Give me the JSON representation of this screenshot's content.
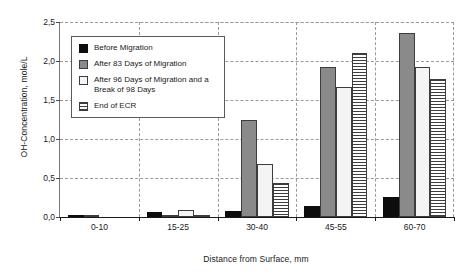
{
  "chart_data": {
    "type": "bar",
    "title": "",
    "xlabel": "Distance from Surface, mm",
    "ylabel": "OH-Concentration, mole/L",
    "categories": [
      "0-10",
      "15-25",
      "30-40",
      "45-55",
      "60-70"
    ],
    "ylim": [
      0,
      2.5
    ],
    "ytick_labels": [
      "0,0",
      "0,5",
      "1,0",
      "1,5",
      "2,0",
      "2,5"
    ],
    "ytick_values": [
      0,
      0.5,
      1.0,
      1.5,
      2.0,
      2.5
    ],
    "grid": true,
    "legend_position": "upper-left-inside",
    "decimal_separator": ",",
    "series": [
      {
        "name": "Before Migration",
        "color": "#0d0d0d",
        "fill": "solid-black",
        "values": [
          0.02,
          0.07,
          0.08,
          0.14,
          0.26
        ]
      },
      {
        "name": "After 83 Days of Migration",
        "color": "#8a8a8a",
        "fill": "solid-gray",
        "values": [
          0.01,
          0.02,
          1.24,
          1.92,
          2.36
        ]
      },
      {
        "name": "After 96 Days of Migration and a Break of 98 Days",
        "color": "#f4f4f4",
        "fill": "solid-white",
        "values": [
          0.0,
          0.09,
          0.68,
          1.67,
          1.92
        ]
      },
      {
        "name": "End of ECR",
        "color": "#3d3d3d",
        "fill": "horizontal-stripes",
        "values": [
          0.0,
          0.02,
          0.44,
          2.1,
          1.77
        ]
      }
    ]
  },
  "legend": {
    "items": [
      {
        "label": "Before Migration",
        "swatch": "swatch-black"
      },
      {
        "label": "After 83 Days of Migration",
        "swatch": "swatch-gray"
      },
      {
        "label": "After 96 Days of Migration and a Break of 98 Days",
        "swatch": "swatch-white"
      },
      {
        "label": "End of ECR",
        "swatch": "swatch-striped"
      }
    ]
  }
}
